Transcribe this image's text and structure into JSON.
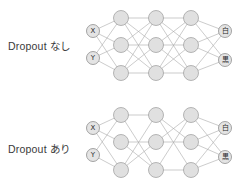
{
  "figure": {
    "title": "",
    "background_color": "#ffffff",
    "node_fill_color": "#e0e0e0",
    "node_stroke_color": "#9a9a9a",
    "edge_color": "#a9a9a9",
    "label_color": "#3a3a3a"
  },
  "rows": [
    {
      "id": "no-dropout",
      "label": "Dropout なし",
      "label_position": {
        "x": 8,
        "y": 38
      }
    },
    {
      "id": "with-dropout",
      "label": "Dropout あり",
      "label_position": {
        "x": 8,
        "y": 141
      }
    }
  ],
  "chart_data": {
    "type": "diagram",
    "diagram_kind": "neural-network",
    "node_radius": 7.5,
    "io_node_radius": 6.5,
    "networks": [
      {
        "id": "network-no-dropout",
        "caption": "Dropout なし",
        "dropout": false,
        "layers": [
          {
            "name": "input",
            "nodes": [
              {
                "id": "in-x",
                "label": "X",
                "x": 93,
                "y": 31
              },
              {
                "id": "in-y",
                "label": "Y",
                "x": 93,
                "y": 58
              }
            ]
          },
          {
            "name": "hidden-1",
            "nodes": [
              {
                "id": "h1-1",
                "label": "",
                "x": 121,
                "y": 18
              },
              {
                "id": "h1-2",
                "label": "",
                "x": 121,
                "y": 45
              },
              {
                "id": "h1-3",
                "label": "",
                "x": 121,
                "y": 73
              }
            ]
          },
          {
            "name": "hidden-2",
            "nodes": [
              {
                "id": "h2-1",
                "label": "",
                "x": 156,
                "y": 18
              },
              {
                "id": "h2-2",
                "label": "",
                "x": 156,
                "y": 45
              },
              {
                "id": "h2-3",
                "label": "",
                "x": 156,
                "y": 73
              }
            ]
          },
          {
            "name": "hidden-3",
            "nodes": [
              {
                "id": "h3-1",
                "label": "",
                "x": 191,
                "y": 18
              },
              {
                "id": "h3-2",
                "label": "",
                "x": 191,
                "y": 45
              },
              {
                "id": "h3-3",
                "label": "",
                "x": 191,
                "y": 73
              }
            ]
          },
          {
            "name": "output",
            "nodes": [
              {
                "id": "out-white",
                "label": "白",
                "x": 225,
                "y": 31
              },
              {
                "id": "out-black",
                "label": "黒",
                "x": 225,
                "y": 60
              }
            ]
          }
        ],
        "edges": [
          [
            "in-x",
            "h1-1"
          ],
          [
            "in-x",
            "h1-2"
          ],
          [
            "in-x",
            "h1-3"
          ],
          [
            "in-y",
            "h1-1"
          ],
          [
            "in-y",
            "h1-2"
          ],
          [
            "in-y",
            "h1-3"
          ],
          [
            "h1-1",
            "h2-1"
          ],
          [
            "h1-1",
            "h2-2"
          ],
          [
            "h1-1",
            "h2-3"
          ],
          [
            "h1-2",
            "h2-1"
          ],
          [
            "h1-2",
            "h2-2"
          ],
          [
            "h1-2",
            "h2-3"
          ],
          [
            "h1-3",
            "h2-1"
          ],
          [
            "h1-3",
            "h2-2"
          ],
          [
            "h1-3",
            "h2-3"
          ],
          [
            "h2-1",
            "h3-1"
          ],
          [
            "h2-1",
            "h3-2"
          ],
          [
            "h2-1",
            "h3-3"
          ],
          [
            "h2-2",
            "h3-1"
          ],
          [
            "h2-2",
            "h3-2"
          ],
          [
            "h2-2",
            "h3-3"
          ],
          [
            "h2-3",
            "h3-1"
          ],
          [
            "h2-3",
            "h3-2"
          ],
          [
            "h2-3",
            "h3-3"
          ],
          [
            "h3-1",
            "out-white"
          ],
          [
            "h3-1",
            "out-black"
          ],
          [
            "h3-2",
            "out-white"
          ],
          [
            "h3-2",
            "out-black"
          ],
          [
            "h3-3",
            "out-white"
          ],
          [
            "h3-3",
            "out-black"
          ]
        ]
      },
      {
        "id": "network-with-dropout",
        "caption": "Dropout あり",
        "dropout": true,
        "layers": [
          {
            "name": "input",
            "nodes": [
              {
                "id": "in-x",
                "label": "X",
                "x": 93,
                "y": 128
              },
              {
                "id": "in-y",
                "label": "Y",
                "x": 93,
                "y": 155
              }
            ]
          },
          {
            "name": "hidden-1",
            "nodes": [
              {
                "id": "h1-1",
                "label": "",
                "x": 121,
                "y": 115
              },
              {
                "id": "h1-2",
                "label": "",
                "x": 121,
                "y": 142
              },
              {
                "id": "h1-3",
                "label": "",
                "x": 121,
                "y": 170
              }
            ]
          },
          {
            "name": "hidden-2",
            "nodes": [
              {
                "id": "h2-1",
                "label": "",
                "x": 156,
                "y": 115
              },
              {
                "id": "h2-2",
                "label": "",
                "x": 156,
                "y": 142
              },
              {
                "id": "h2-3",
                "label": "",
                "x": 156,
                "y": 170
              }
            ]
          },
          {
            "name": "hidden-3",
            "nodes": [
              {
                "id": "h3-1",
                "label": "",
                "x": 191,
                "y": 115
              },
              {
                "id": "h3-2",
                "label": "",
                "x": 191,
                "y": 142
              },
              {
                "id": "h3-3",
                "label": "",
                "x": 191,
                "y": 170
              }
            ]
          },
          {
            "name": "output",
            "nodes": [
              {
                "id": "out-white",
                "label": "白",
                "x": 225,
                "y": 128
              },
              {
                "id": "out-black",
                "label": "黒",
                "x": 225,
                "y": 157
              }
            ]
          }
        ],
        "edges": [
          [
            "in-x",
            "h1-1"
          ],
          [
            "in-x",
            "h1-2"
          ],
          [
            "in-x",
            "h1-3"
          ],
          [
            "in-y",
            "h1-1"
          ],
          [
            "in-y",
            "h1-3"
          ],
          [
            "h1-1",
            "h2-1"
          ],
          [
            "h1-1",
            "h2-3"
          ],
          [
            "h1-2",
            "h2-2"
          ],
          [
            "h1-2",
            "h2-3"
          ],
          [
            "h1-3",
            "h2-1"
          ],
          [
            "h1-3",
            "h2-2"
          ],
          [
            "h2-1",
            "h3-2"
          ],
          [
            "h2-1",
            "h3-3"
          ],
          [
            "h2-2",
            "h3-1"
          ],
          [
            "h2-2",
            "h3-2"
          ],
          [
            "h2-3",
            "h3-1"
          ],
          [
            "h2-3",
            "h3-3"
          ],
          [
            "h3-1",
            "out-white"
          ],
          [
            "h3-1",
            "out-black"
          ],
          [
            "h3-2",
            "out-white"
          ],
          [
            "h3-2",
            "out-black"
          ],
          [
            "h3-3",
            "out-white"
          ],
          [
            "h3-3",
            "out-black"
          ]
        ]
      }
    ]
  }
}
